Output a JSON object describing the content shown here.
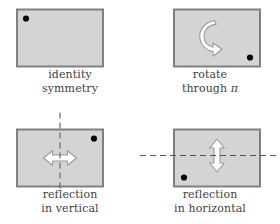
{
  "figure": {
    "colors": {
      "rect_fill": "#d4d4d4",
      "rect_border": "#808080",
      "dot": "#000000",
      "arrow_fill": "#ffffff",
      "arrow_stroke": "#9a9a9a",
      "dashed_line": "#555555",
      "caption_text": "#3f3f3f",
      "background": "#ffffff"
    },
    "panels": [
      {
        "id": "identity",
        "caption_line1": "identity",
        "caption_line2": "symmetry",
        "dot_position": "top-left",
        "marker_dot": "●",
        "symbol": "none",
        "axis": "none"
      },
      {
        "id": "rotation",
        "caption_line1": "rotate",
        "caption_line2": "through",
        "caption_line2_symbol": "π",
        "dot_position": "bottom-right",
        "marker_dot": "●",
        "symbol": "curved-rotation-arrow",
        "axis": "none"
      },
      {
        "id": "reflection-vertical",
        "caption_line1": "reflection",
        "caption_line2": "in vertical",
        "dot_position": "top-right",
        "marker_dot": "●",
        "symbol": "horizontal-double-arrow",
        "axis": "vertical-dashed"
      },
      {
        "id": "reflection-horizontal",
        "caption_line1": "reflection",
        "caption_line2": "in horizontal",
        "dot_position": "bottom-left",
        "marker_dot": "●",
        "symbol": "vertical-double-arrow",
        "axis": "horizontal-dashed"
      }
    ]
  }
}
